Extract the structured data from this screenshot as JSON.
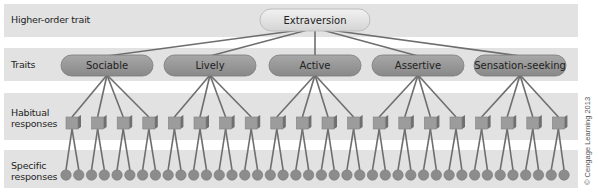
{
  "diagram": {
    "levels": [
      {
        "label": "Higher-order trait"
      },
      {
        "label": "Traits"
      },
      {
        "label": "Habitual responses"
      },
      {
        "label": "Specific responses"
      }
    ],
    "higher_order_trait": {
      "label": "Extraversion"
    },
    "traits": [
      {
        "label": "Sociable",
        "habitual_responses": 4
      },
      {
        "label": "Lively",
        "habitual_responses": 4
      },
      {
        "label": "Active",
        "habitual_responses": 4
      },
      {
        "label": "Assertive",
        "habitual_responses": 4
      },
      {
        "label": "Sensation-seeking",
        "habitual_responses": 4
      }
    ],
    "habitual_response_count": 20,
    "specific_responses_per_habitual": 2,
    "specific_response_count": 40,
    "credit": "© Cengage Learning 2013",
    "colors": {
      "band": "#e2e2e2",
      "trait_fill": "#9a9a9a",
      "top_fill": "#e6e6e6",
      "line": "#6e6e6e",
      "node": "#8c8c8c"
    }
  }
}
